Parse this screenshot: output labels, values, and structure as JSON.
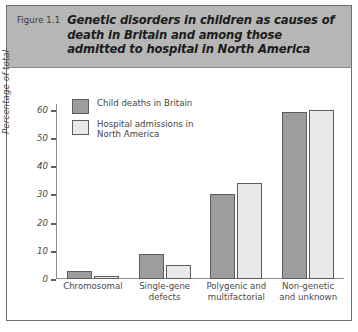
{
  "figure": {
    "label": "Figure 1.1",
    "title": "Genetic disorders in children as causes of death in Britain and among those admitted to hospital in North America"
  },
  "colors": {
    "series_dark": "#9d9d9d",
    "series_light": "#e9e9e9",
    "header_band": "#b6b6b6",
    "frame": "#6e6e6e",
    "axis": "#8e8e8e",
    "text": "#4a4a4a"
  },
  "chart_data": {
    "type": "bar",
    "title": "Genetic disorders in children as causes of death in Britain and among those admitted to hospital in North America",
    "xlabel": "",
    "ylabel": "Percentage of total",
    "ylim": [
      0,
      62
    ],
    "yticks": [
      0,
      10,
      20,
      30,
      40,
      50,
      60
    ],
    "ytick_labels": [
      "0",
      "10",
      "20",
      "30",
      "40",
      "50",
      "60"
    ],
    "grid": false,
    "legend_position": "top-left",
    "categories": [
      "Chromosomal",
      "Single-gene\ndefects",
      "Polygenic and\nmultifactorial",
      "Non-genetic\nand unknown"
    ],
    "series": [
      {
        "name": "Child deaths in Britain",
        "color": "#9d9d9d",
        "values": [
          3,
          9,
          30,
          59
        ]
      },
      {
        "name": "Hospital admissions in\nNorth America",
        "color": "#e9e9e9",
        "values": [
          1,
          5,
          34,
          60
        ]
      }
    ]
  }
}
